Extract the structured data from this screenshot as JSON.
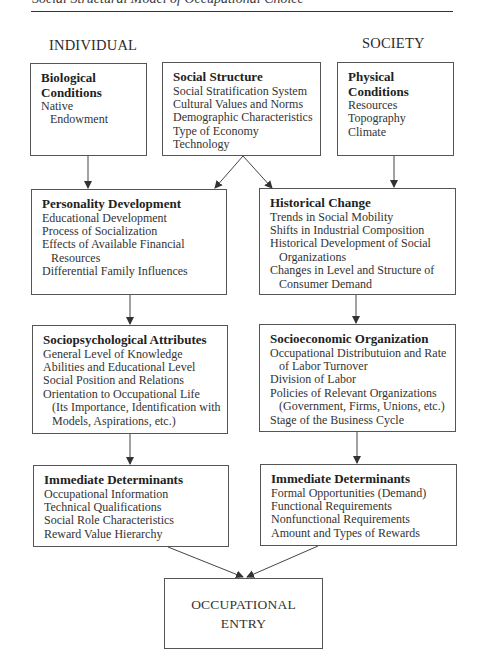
{
  "page": {
    "running_header": "Social Structural Model of Occupational Choice"
  },
  "columns": {
    "left_label": "INDIVIDUAL",
    "right_label": "SOCIETY"
  },
  "boxes": {
    "biological": {
      "title_lines": [
        "Biological",
        "Conditions"
      ],
      "items": [
        {
          "text": "Native",
          "indent": false
        },
        {
          "text": "Endowment",
          "indent": true
        }
      ]
    },
    "social_structure": {
      "title_lines": [
        "Social Structure"
      ],
      "items": [
        {
          "text": "Social Stratification System",
          "indent": false
        },
        {
          "text": "Cultural Values and Norms",
          "indent": false
        },
        {
          "text": "Demographic Characteristics",
          "indent": false
        },
        {
          "text": "Type of Economy",
          "indent": false
        },
        {
          "text": "Technology",
          "indent": false
        }
      ]
    },
    "physical": {
      "title_lines": [
        "Physical",
        "Conditions"
      ],
      "items": [
        {
          "text": "Resources",
          "indent": false
        },
        {
          "text": "Topography",
          "indent": false
        },
        {
          "text": "Climate",
          "indent": false
        }
      ]
    },
    "personality": {
      "title_lines": [
        "Personality Development"
      ],
      "items": [
        {
          "text": "Educational Development",
          "indent": false
        },
        {
          "text": "Process of Socialization",
          "indent": false
        },
        {
          "text": "Effects of Available Financial",
          "indent": false
        },
        {
          "text": "Resources",
          "indent": true
        },
        {
          "text": "Differential Family Influences",
          "indent": false
        }
      ]
    },
    "historical": {
      "title_lines": [
        "Historical Change"
      ],
      "items": [
        {
          "text": "Trends in Social Mobility",
          "indent": false
        },
        {
          "text": "Shifts in Industrial Composition",
          "indent": false
        },
        {
          "text": "Historical Development of Social",
          "indent": false
        },
        {
          "text": "Organizations",
          "indent": true
        },
        {
          "text": "Changes in Level and Structure of",
          "indent": false
        },
        {
          "text": "Consumer Demand",
          "indent": true
        }
      ]
    },
    "sociopsychological": {
      "title_lines": [
        "Sociopsychological Attributes"
      ],
      "items": [
        {
          "text": "General Level of Knowledge",
          "indent": false
        },
        {
          "text": "Abilities and Educational Level",
          "indent": false
        },
        {
          "text": "Social Position and Relations",
          "indent": false
        },
        {
          "text": "Orientation to Occupational Life",
          "indent": false
        },
        {
          "text": "(Its Importance, Identification with",
          "indent": true
        },
        {
          "text": "Models, Aspirations, etc.)",
          "indent": true
        }
      ]
    },
    "socioeconomic": {
      "title_lines": [
        "Socioeconomic Organization"
      ],
      "items": [
        {
          "text": "Occupational Distributuion and Rate",
          "indent": false
        },
        {
          "text": "of Labor Turnover",
          "indent": true
        },
        {
          "text": "Division of Labor",
          "indent": false
        },
        {
          "text": "Policies of Relevant Organizations",
          "indent": false
        },
        {
          "text": "(Government, Firms, Unions, etc.)",
          "indent": true
        },
        {
          "text": "Stage of the Business Cycle",
          "indent": false
        }
      ]
    },
    "immediate_individual": {
      "title_lines": [
        "Immediate Determinants"
      ],
      "items": [
        {
          "text": "Occupational Information",
          "indent": false
        },
        {
          "text": "Technical Qualifications",
          "indent": false
        },
        {
          "text": "Social Role Characteristics",
          "indent": false
        },
        {
          "text": "Reward Value Hierarchy",
          "indent": false
        }
      ]
    },
    "immediate_society": {
      "title_lines": [
        "Immediate Determinants"
      ],
      "items": [
        {
          "text": "Formal Opportunities (Demand)",
          "indent": false
        },
        {
          "text": "Functional Requirements",
          "indent": false
        },
        {
          "text": "Nonfunctional Requirements",
          "indent": false
        },
        {
          "text": "Amount and Types of Rewards",
          "indent": false
        }
      ]
    },
    "occupational_entry": {
      "lines": [
        "OCCUPATIONAL",
        "ENTRY"
      ]
    }
  },
  "edges": [
    {
      "from": "biological",
      "to": "personality"
    },
    {
      "from": "social_structure",
      "to": "personality"
    },
    {
      "from": "social_structure",
      "to": "historical"
    },
    {
      "from": "physical",
      "to": "historical"
    },
    {
      "from": "personality",
      "to": "sociopsychological"
    },
    {
      "from": "historical",
      "to": "socioeconomic"
    },
    {
      "from": "sociopsychological",
      "to": "immediate_individual"
    },
    {
      "from": "socioeconomic",
      "to": "immediate_society"
    },
    {
      "from": "immediate_individual",
      "to": "occupational_entry"
    },
    {
      "from": "immediate_society",
      "to": "occupational_entry"
    }
  ],
  "colors": {
    "line": "#444444",
    "border": "#555555",
    "text": "#2b2b2b"
  }
}
